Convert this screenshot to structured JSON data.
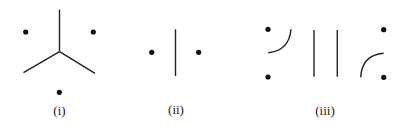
{
  "figure": {
    "panels": [
      {
        "id": "i",
        "label": "(i)",
        "description": "three vertices separated by a Y-shaped tripod of edges",
        "dot_count": 3,
        "segments": [
          "vertical",
          "lower-left",
          "lower-right"
        ]
      },
      {
        "id": "ii",
        "label": "(ii)",
        "description": "two vertices separated by a single vertical edge",
        "dot_count": 2,
        "segments": [
          "vertical"
        ]
      },
      {
        "id": "iii",
        "label": "(iii)",
        "description": "four vertices with two vertical edges and two curved arcs",
        "dot_count": 4,
        "segments": [
          "arc-top-left",
          "vertical-left",
          "vertical-right",
          "arc-bottom-right"
        ]
      }
    ]
  }
}
